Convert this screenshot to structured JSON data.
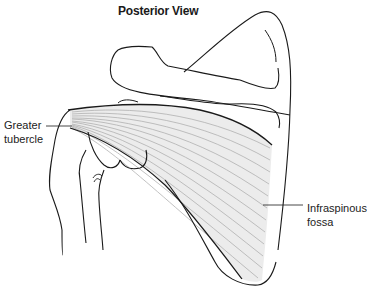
{
  "figure": {
    "title": "Posterior View",
    "labels": [
      {
        "id": "greater-tubercle",
        "line1": "Greater",
        "line2": "tubercle"
      },
      {
        "id": "infraspinous-fossa",
        "line1": "Infraspinous",
        "line2": "fossa"
      }
    ],
    "colors": {
      "outline": "#1a1a1a",
      "muscle_fill": "#ececec",
      "fiber_line": "#a8a8a8",
      "background": "#ffffff"
    }
  }
}
